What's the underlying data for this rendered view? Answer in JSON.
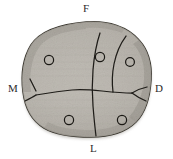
{
  "figure": {
    "background_color": "#ffffff",
    "width": 173,
    "height": 159
  },
  "orientation_labels": [
    {
      "id": "F",
      "text": "F",
      "meaning": "facial",
      "x": 88,
      "y": 9
    },
    {
      "id": "M",
      "text": "M",
      "meaning": "mesial",
      "x": 13,
      "y": 89
    },
    {
      "id": "D",
      "text": "D",
      "meaning": "distal",
      "x": 160,
      "y": 89
    },
    {
      "id": "L",
      "text": "L",
      "meaning": "lingual",
      "x": 95,
      "y": 149
    }
  ],
  "specimen": {
    "outline_color": "#2a2722",
    "fill_light": "#c9c6bf",
    "fill_mid": "#b2aea6",
    "fill_dark": "#8d8982",
    "edge_shadow": "#6f6b64"
  },
  "cusps": [
    {
      "id": "cusp-1",
      "label": "",
      "cx": 49,
      "cy": 60,
      "r": 4.6
    },
    {
      "id": "cusp-2",
      "label": "",
      "cx": 100,
      "cy": 57,
      "r": 4.6
    },
    {
      "id": "cusp-3",
      "label": "",
      "cx": 130,
      "cy": 62,
      "r": 4.4
    },
    {
      "id": "cusp-4",
      "label": "",
      "cx": 69,
      "cy": 120,
      "r": 4.6
    },
    {
      "id": "cusp-5",
      "label": "",
      "cx": 122,
      "cy": 120,
      "r": 4.6
    }
  ],
  "fissures": [
    {
      "id": "central-groove",
      "description": "main vertical groove running facial to lingual"
    },
    {
      "id": "transverse-groove",
      "description": "horizontal groove running mesial to distal"
    },
    {
      "id": "distobuccal-groove",
      "description": "curved groove near distal-facial corner"
    },
    {
      "id": "mesial-branch",
      "description": "Y-shaped branch near mesial margin"
    },
    {
      "id": "distal-branch",
      "description": "short branch near distal margin"
    }
  ],
  "chart_data": {
    "type": "scatter",
    "xlabel": "",
    "ylabel": "",
    "categories": [
      "F",
      "M",
      "D",
      "L"
    ],
    "series": [
      {
        "name": "cusp markers",
        "points": [
          {
            "x": 49,
            "y": 60
          },
          {
            "x": 100,
            "y": 57
          },
          {
            "x": 130,
            "y": 62
          },
          {
            "x": 69,
            "y": 120
          },
          {
            "x": 122,
            "y": 120
          }
        ]
      }
    ]
  }
}
